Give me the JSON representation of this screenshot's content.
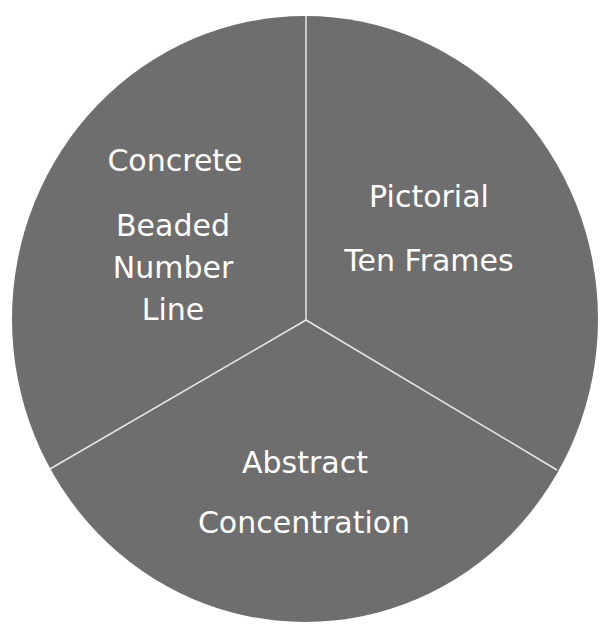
{
  "diagram": {
    "type": "three-sector circle",
    "colors": {
      "fill": "#6e6e6e",
      "divider": "#e6e6e6",
      "text": "#ffffff",
      "background": "#ffffff"
    },
    "sectors": [
      {
        "stage": "Concrete",
        "example_lines": [
          "Beaded",
          "Number",
          "Line"
        ]
      },
      {
        "stage": "Pictorial",
        "example_lines": [
          "Ten Frames"
        ]
      },
      {
        "stage": "Abstract",
        "example_lines": [
          "Concentration"
        ]
      }
    ]
  }
}
